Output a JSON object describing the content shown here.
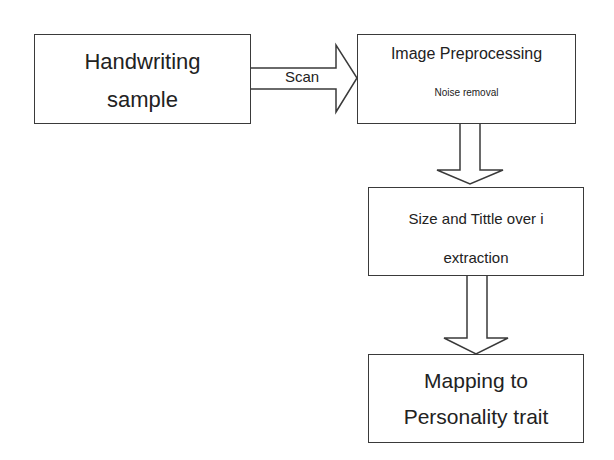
{
  "diagram": {
    "type": "flowchart",
    "nodes": [
      {
        "id": "handwriting",
        "lines": [
          "Handwriting",
          "sample"
        ]
      },
      {
        "id": "preprocessing",
        "title": "Image Preprocessing",
        "subtitle": "Noise removal"
      },
      {
        "id": "extraction",
        "lines": [
          "Size and Tittle over i",
          "extraction"
        ]
      },
      {
        "id": "mapping",
        "lines": [
          "Mapping to",
          "Personality trait"
        ]
      }
    ],
    "edges": [
      {
        "from": "handwriting",
        "to": "preprocessing",
        "label": "Scan",
        "style": "block-arrow-right"
      },
      {
        "from": "preprocessing",
        "to": "extraction",
        "label": "",
        "style": "block-arrow-down"
      },
      {
        "from": "extraction",
        "to": "mapping",
        "label": "",
        "style": "block-arrow-down"
      }
    ]
  }
}
